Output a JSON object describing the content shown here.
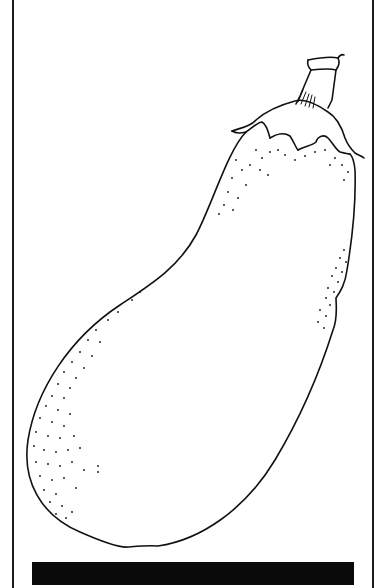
{
  "image": {
    "subject": "Eggplant line illustration",
    "style": "pen-and-ink line drawing with stippling",
    "colors": {
      "background": "#ffffff",
      "ink": "#111111",
      "frame": "#1a1a1a",
      "bar": "#0a0a0a"
    },
    "elements": [
      "eggplant-body",
      "calyx",
      "stem",
      "stipple-shading",
      "frame-lines",
      "base-bar"
    ]
  }
}
